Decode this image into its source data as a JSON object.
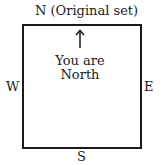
{
  "labels": {
    "north": "N (Original set)",
    "south": "S",
    "east": "E",
    "west": "W"
  },
  "center": {
    "line1": "You are",
    "line2": "North"
  },
  "icons": {
    "arrow": "up-arrow"
  }
}
